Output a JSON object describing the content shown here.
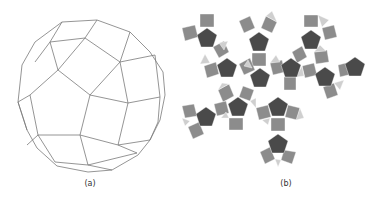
{
  "figure": {
    "panels": [
      {
        "id": "a",
        "caption": "(a)",
        "description": "Wireframe perspective view of a rhombicosidodecahedron (squares, pentagons, triangles)",
        "stroke_color": "#7a7a7a"
      },
      {
        "id": "b",
        "caption": "(b)",
        "description": "Flattened net of the rhombicosidodecahedron",
        "colors": {
          "pentagon": "#4a4a4a",
          "square": "#8c8c8c",
          "triangle": "#cfcfcf"
        }
      }
    ]
  }
}
